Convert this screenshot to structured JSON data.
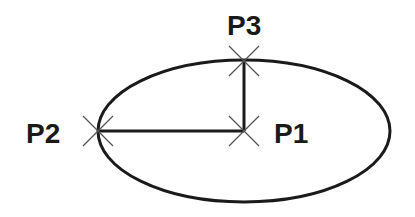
{
  "diagram": {
    "type": "ellipse-construction",
    "colors": {
      "stroke": "#1a1a1a",
      "marker": "#555555",
      "background": "#ffffff"
    },
    "ellipse": {
      "cx": 244,
      "cy": 131,
      "rx": 146,
      "ry": 71
    },
    "points": [
      {
        "id": "p1",
        "label": "P1",
        "x": 244,
        "y": 131,
        "label_x": 274,
        "label_y": 143
      },
      {
        "id": "p2",
        "label": "P2",
        "x": 98,
        "y": 131,
        "label_x": 26,
        "label_y": 143
      },
      {
        "id": "p3",
        "label": "P3",
        "x": 244,
        "y": 61,
        "label_x": 227,
        "label_y": 35
      }
    ],
    "lines": [
      {
        "from": "p1",
        "to": "p2"
      },
      {
        "from": "p1",
        "to": "p3"
      }
    ]
  }
}
